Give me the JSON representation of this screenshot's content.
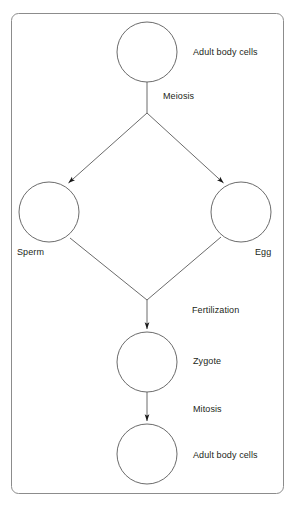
{
  "diagram": {
    "type": "flow-diagram",
    "frame": {
      "stroke": "#8c8c8c",
      "fill": "#ffffff",
      "x": 11,
      "y": 13,
      "width": 273,
      "height": 481,
      "corner_radius": 7
    },
    "colors": {
      "stroke": "#5a5a5a",
      "text": "#231f20",
      "arrow": "#1a1a1a",
      "background": "#ffffff"
    },
    "nodes": [
      {
        "id": "adult-body-cells-top",
        "shape": "circle",
        "cx": 147,
        "cy": 52,
        "r": 30,
        "label": "Adult body cells",
        "label_x": 193,
        "label_y": 47
      },
      {
        "id": "sperm",
        "shape": "circle",
        "cx": 49,
        "cy": 212,
        "r": 30,
        "label": "Sperm",
        "label_x": 17,
        "label_y": 247
      },
      {
        "id": "egg",
        "shape": "circle",
        "cx": 241,
        "cy": 212,
        "r": 30,
        "label": "Egg",
        "label_x": 255,
        "label_y": 247
      },
      {
        "id": "zygote",
        "shape": "circle",
        "cx": 147,
        "cy": 362,
        "r": 30,
        "label": "Zygote",
        "label_x": 193,
        "label_y": 356
      },
      {
        "id": "adult-body-cells-bottom",
        "shape": "circle",
        "cx": 147,
        "cy": 454,
        "r": 30,
        "label": "Adult body cells",
        "label_x": 193,
        "label_y": 450
      }
    ],
    "process_labels": [
      {
        "id": "meiosis",
        "text": "Meiosis",
        "x": 163,
        "y": 91
      },
      {
        "id": "fertilization",
        "text": "Fertilization",
        "x": 192,
        "y": 305
      },
      {
        "id": "mitosis",
        "text": "Mitosis",
        "x": 193,
        "y": 404
      }
    ],
    "connectors": [
      {
        "id": "top-cell-to-split",
        "from": "adult-body-cells-top",
        "to": "meiosis-split",
        "kind": "line",
        "points": "147,82 147,113"
      },
      {
        "id": "split-to-sperm",
        "from": "meiosis-split",
        "to": "sperm",
        "kind": "arrow",
        "points": "147,113 69,183"
      },
      {
        "id": "split-to-egg",
        "from": "meiosis-split",
        "to": "egg",
        "kind": "arrow",
        "points": "147,113 223,183"
      },
      {
        "id": "sperm-to-junction",
        "from": "sperm",
        "to": "fertilization-junction",
        "kind": "line",
        "points": "70,238 147,300"
      },
      {
        "id": "egg-to-junction",
        "from": "egg",
        "to": "fertilization-junction",
        "kind": "line",
        "points": "221,237 147,300"
      },
      {
        "id": "junction-to-zygote",
        "from": "fertilization-junction",
        "to": "zygote",
        "kind": "arrow",
        "points": "147,300 147,330"
      },
      {
        "id": "zygote-to-adult",
        "from": "zygote",
        "to": "adult-body-cells-bottom",
        "kind": "arrow",
        "points": "147,392 147,422"
      }
    ]
  }
}
